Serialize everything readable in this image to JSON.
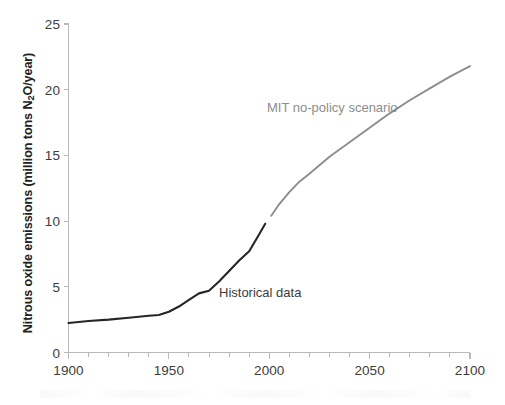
{
  "chart_data": {
    "type": "line",
    "title": "",
    "xlabel": "",
    "ylabel": "Nitrous oxide emissions (million tons N2O/year)",
    "ylabel_prefix": "Nitrous oxide emissions (million tons N",
    "ylabel_sub": "2",
    "ylabel_suffix": "O/year)",
    "xlim": [
      1900,
      2100
    ],
    "ylim": [
      0,
      25
    ],
    "grid": false,
    "legend_position": "inline-annotations",
    "x_major_ticks": [
      1900,
      1950,
      2000,
      2050,
      2100
    ],
    "x_major_tick_labels": [
      "1900",
      "1950",
      "2000",
      "2050",
      "2100"
    ],
    "x_minor_tick_step": 10,
    "y_major_ticks": [
      0,
      5,
      10,
      15,
      20,
      25
    ],
    "y_major_tick_labels": [
      "0",
      "5",
      "10",
      "15",
      "20",
      "25"
    ],
    "series": [
      {
        "name": "Historical data",
        "color": "#262626",
        "annotation": "Historical data",
        "x": [
          1900,
          1910,
          1920,
          1930,
          1940,
          1945,
          1950,
          1955,
          1960,
          1965,
          1970,
          1975,
          1980,
          1985,
          1990,
          1995,
          1998
        ],
        "values": [
          2.25,
          2.4,
          2.5,
          2.65,
          2.8,
          2.85,
          3.1,
          3.5,
          4.0,
          4.5,
          4.7,
          5.4,
          6.2,
          7.0,
          7.7,
          9.0,
          9.8
        ]
      },
      {
        "name": "MIT no-policy scenario",
        "color": "#8d8d8d",
        "annotation": "MIT no-policy scenario",
        "x": [
          2001,
          2005,
          2010,
          2015,
          2020,
          2030,
          2040,
          2050,
          2060,
          2070,
          2080,
          2090,
          2100
        ],
        "values": [
          10.4,
          11.3,
          12.2,
          13.0,
          13.6,
          14.9,
          16.0,
          17.1,
          18.2,
          19.2,
          20.1,
          21.0,
          21.8
        ]
      }
    ]
  }
}
